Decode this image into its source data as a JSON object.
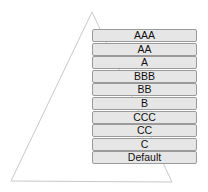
{
  "diagram": {
    "shape": "pyramid-triangle",
    "triangle": {
      "apex": [
        92,
        12
      ],
      "base_left": [
        11,
        181
      ],
      "base_right": [
        172,
        182
      ],
      "stroke": "#c8c8c8"
    },
    "box_fill": "#e6e6e6",
    "box_border": "#9a9a9a",
    "ratings": [
      {
        "label": "AAA"
      },
      {
        "label": "AA"
      },
      {
        "label": "A"
      },
      {
        "label": "BBB"
      },
      {
        "label": "BB"
      },
      {
        "label": "B"
      },
      {
        "label": "CCC"
      },
      {
        "label": "CC"
      },
      {
        "label": "C"
      },
      {
        "label": "Default"
      }
    ]
  }
}
